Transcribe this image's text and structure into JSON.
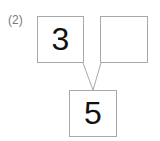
{
  "problem": {
    "label": "(2)"
  },
  "diagram": {
    "type": "number-bond",
    "nodes": {
      "addend_left": {
        "value": "3",
        "empty": false
      },
      "addend_right": {
        "value": "",
        "empty": true
      },
      "sum": {
        "value": "5",
        "empty": false
      }
    },
    "connectors": [
      {
        "from": "addend_left",
        "to": "sum"
      },
      {
        "from": "addend_right",
        "to": "sum"
      }
    ]
  },
  "colors": {
    "background": "#ffffff",
    "box_border": "#a8a8a8",
    "connector_line": "#a8a8a8",
    "digit_text": "#111111",
    "label_text": "#7a7a7a"
  }
}
